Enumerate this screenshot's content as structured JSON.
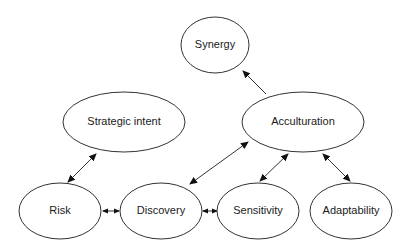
{
  "diagram": {
    "type": "concept-map",
    "nodes": [
      {
        "id": "synergy",
        "label": "Synergy",
        "cx": 215,
        "cy": 45,
        "rx": 34,
        "ry": 28
      },
      {
        "id": "strategic_intent",
        "label": "Strategic intent",
        "cx": 124,
        "cy": 122,
        "rx": 61,
        "ry": 30
      },
      {
        "id": "acculturation",
        "label": "Acculturation",
        "cx": 303,
        "cy": 122,
        "rx": 61,
        "ry": 30
      },
      {
        "id": "risk",
        "label": "Risk",
        "cx": 60,
        "cy": 211,
        "rx": 41,
        "ry": 28
      },
      {
        "id": "discovery",
        "label": "Discovery",
        "cx": 161,
        "cy": 211,
        "rx": 41,
        "ry": 28
      },
      {
        "id": "sensitivity",
        "label": "Sensitivity",
        "cx": 258,
        "cy": 211,
        "rx": 41,
        "ry": 28
      },
      {
        "id": "adaptability",
        "label": "Adaptability",
        "cx": 351,
        "cy": 211,
        "rx": 41,
        "ry": 28
      }
    ],
    "edges": [
      {
        "from": "acculturation",
        "to": "synergy",
        "direction": "forward"
      },
      {
        "from": "risk",
        "to": "strategic_intent",
        "direction": "both"
      },
      {
        "from": "discovery",
        "to": "acculturation",
        "direction": "both"
      },
      {
        "from": "sensitivity",
        "to": "acculturation",
        "direction": "both"
      },
      {
        "from": "acculturation",
        "to": "adaptability",
        "direction": "both"
      },
      {
        "from": "risk",
        "to": "discovery",
        "direction": "both"
      },
      {
        "from": "discovery",
        "to": "sensitivity",
        "direction": "both"
      }
    ]
  },
  "labels": {
    "synergy": "Synergy",
    "strategic_intent": "Strategic intent",
    "acculturation": "Acculturation",
    "risk": "Risk",
    "discovery": "Discovery",
    "sensitivity": "Sensitivity",
    "adaptability": "Adaptability"
  }
}
